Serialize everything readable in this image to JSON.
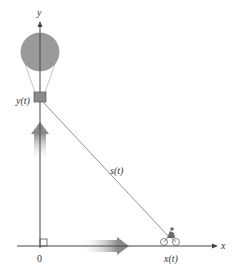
{
  "diagram": {
    "type": "related-rates",
    "axes": {
      "x_label": "x",
      "y_label": "y",
      "origin_label": "0"
    },
    "labels": {
      "balloon_height": "y(t)",
      "distance": "s(t)",
      "bicycle_position": "x(t)"
    },
    "objects": {
      "balloon": "hot-air-balloon",
      "vehicle": "bicycle",
      "right_angle_marker": true,
      "motion_arrows": [
        "up",
        "right"
      ]
    },
    "colors": {
      "balloon_fill": "#9a9a9a",
      "axis": "#444444",
      "arrow_dark": "#8a8a8a",
      "line": "#777777"
    }
  }
}
